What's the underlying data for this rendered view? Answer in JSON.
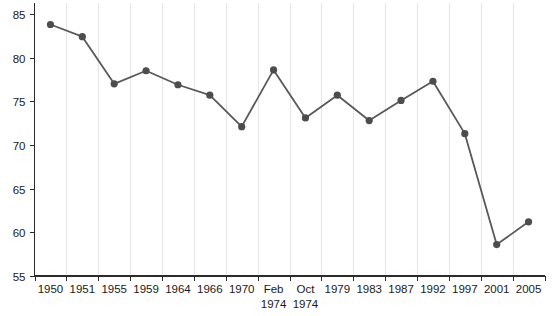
{
  "chart_data": {
    "type": "line",
    "title": "",
    "subtitle": "",
    "xlabel": "",
    "ylabel": "",
    "categories": [
      "1950",
      "1951",
      "1955",
      "1959",
      "1964",
      "1966",
      "1970",
      "Feb\n1974",
      "Oct\n1974",
      "1979",
      "1983",
      "1987",
      "1992",
      "1997",
      "2001",
      "2005"
    ],
    "category_lines": [
      [
        "1950"
      ],
      [
        "1951"
      ],
      [
        "1955"
      ],
      [
        "1959"
      ],
      [
        "1964"
      ],
      [
        "1966"
      ],
      [
        "1970"
      ],
      [
        "Feb",
        "1974"
      ],
      [
        "Oct",
        "1974"
      ],
      [
        "1979"
      ],
      [
        "1983"
      ],
      [
        "1987"
      ],
      [
        "1992"
      ],
      [
        "1997"
      ],
      [
        "2001"
      ],
      [
        "2005"
      ]
    ],
    "values": [
      83.8,
      82.4,
      77.0,
      78.5,
      76.9,
      75.7,
      72.1,
      78.6,
      73.1,
      75.7,
      72.8,
      75.1,
      77.3,
      71.3,
      58.6,
      61.2
    ],
    "ylim": [
      55,
      85
    ],
    "yticks": [
      55,
      60,
      65,
      70,
      75,
      80,
      85
    ],
    "ytick_labels": [
      "55",
      "60",
      "65",
      "70",
      "75",
      "80",
      "85"
    ],
    "grid": "vertical-only",
    "legend": "none",
    "series": [
      {
        "name": "turnout",
        "color": "#595959",
        "marker": "circle",
        "values": [
          83.8,
          82.4,
          77.0,
          78.5,
          76.9,
          75.7,
          72.1,
          78.6,
          73.1,
          75.7,
          72.8,
          75.1,
          77.3,
          71.3,
          58.6,
          61.2
        ]
      }
    ]
  },
  "colors": {
    "line": "#595959",
    "marker": "#4d4d4d",
    "grid": "#e6e6e6",
    "axis": "#2b2b2b",
    "text": "#1a1a1a",
    "background": "#ffffff"
  }
}
